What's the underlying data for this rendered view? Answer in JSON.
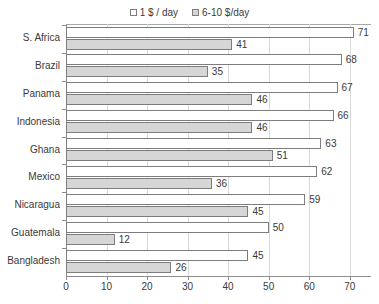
{
  "chart_data": {
    "type": "bar",
    "orientation": "horizontal",
    "title": "",
    "xlabel": "",
    "ylabel": "",
    "xlim": [
      0,
      75
    ],
    "xticks": [
      0,
      10,
      20,
      30,
      40,
      50,
      60,
      70
    ],
    "grid": true,
    "legend_position": "top-center",
    "categories": [
      "S. Africa",
      "Brazil",
      "Panama",
      "Indonesia",
      "Ghana",
      "Mexico",
      "Nicaragua",
      "Guatemala",
      "Bangladesh"
    ],
    "series": [
      {
        "name": "1 $ / day",
        "color": "#ffffff",
        "border": "#7d7d7d",
        "values": [
          71,
          68,
          67,
          66,
          63,
          62,
          59,
          50,
          45
        ]
      },
      {
        "name": "6-10 $/day",
        "color": "#d6d6d6",
        "border": "#7d7d7d",
        "values": [
          41,
          35,
          46,
          46,
          51,
          36,
          45,
          12,
          26
        ]
      }
    ]
  },
  "legend": {
    "entries": [
      {
        "label": "1 $ / day"
      },
      {
        "label": "6-10 $/day"
      }
    ]
  },
  "axis": {
    "tick_labels": [
      "0",
      "10",
      "20",
      "30",
      "40",
      "50",
      "60",
      "70"
    ]
  }
}
